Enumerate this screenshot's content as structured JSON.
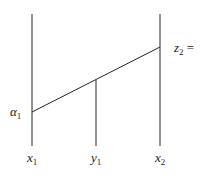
{
  "diagram": {
    "lines": {
      "left_vertical": {
        "x": 32,
        "y1": 14,
        "y2": 146
      },
      "middle_vertical": {
        "x": 96,
        "y1": 80,
        "y2": 146
      },
      "right_vertical": {
        "x": 160,
        "y1": 14,
        "y2": 146
      },
      "slant": {
        "x1": 32,
        "y1": 112,
        "x2": 160,
        "y2": 47
      }
    },
    "stroke_color": "#222222",
    "labels": {
      "alpha": {
        "base": "α",
        "sub": "1"
      },
      "z": {
        "base": "z",
        "sub": "2",
        "suffix": " ="
      },
      "x1": {
        "base": "x",
        "sub": "1"
      },
      "y1": {
        "base": "y",
        "sub": "1"
      },
      "x2": {
        "base": "x",
        "sub": "2"
      }
    }
  }
}
